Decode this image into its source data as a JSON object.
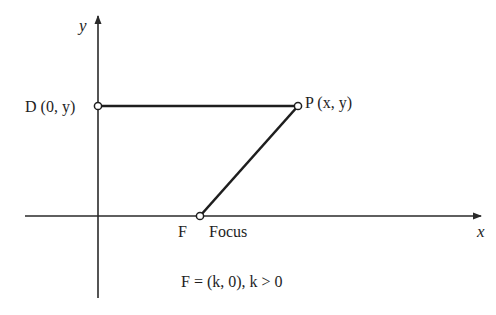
{
  "diagram": {
    "type": "parabola-definition",
    "axes": {
      "x_label": "x",
      "y_label": "y"
    },
    "points": [
      {
        "id": "D",
        "label": "D (0, y)",
        "px": 98,
        "py": 106
      },
      {
        "id": "P",
        "label": "P (x, y)",
        "px": 298,
        "py": 106
      },
      {
        "id": "F",
        "label": "F",
        "px": 200,
        "py": 216
      }
    ],
    "focus_label": "Focus",
    "caption": "F = (k, 0), k > 0",
    "segments": [
      {
        "from": "D",
        "to": "P"
      },
      {
        "from": "P",
        "to": "F"
      }
    ],
    "colors": {
      "line": "#1e1e1e",
      "axis": "#2a2a2a",
      "background": "#ffffff"
    }
  }
}
